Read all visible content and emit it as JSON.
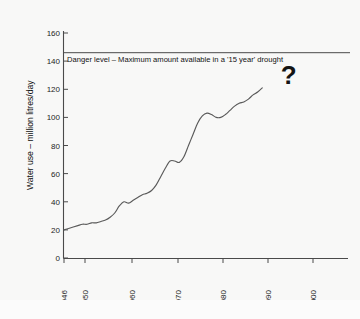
{
  "figure": {
    "background_color": "#f8f8f7",
    "line_color": "#5a5a5a",
    "axis_color": "#4a4a4a",
    "text_color": "#111111"
  },
  "caption": {
    "text": ""
  },
  "annotations": {
    "danger_label": "Danger level – Maximum amount available in a '15 year' drought",
    "question_mark": "?"
  },
  "chart_data": {
    "type": "line",
    "title": "",
    "subtitle": "",
    "xlabel": "",
    "ylabel": "Water use – million litres/day",
    "xlim": [
      1945,
      2004
    ],
    "ylim": [
      0,
      160
    ],
    "grid": false,
    "legend": "none",
    "xticks": [
      1946,
      1950,
      1960,
      1970,
      1980,
      1990,
      2000
    ],
    "xticklabels": [
      "1946",
      "1950",
      "1960",
      "1970",
      "1980",
      "1990",
      "2000"
    ],
    "yticks": [
      0,
      20,
      40,
      60,
      80,
      100,
      120,
      140,
      160
    ],
    "yticklabels": [
      "0",
      "20",
      "40",
      "60",
      "80",
      "100",
      "120",
      "140",
      "160"
    ],
    "annotations": [
      {
        "name": "danger-level-line",
        "type": "hline",
        "value": 146,
        "label": "Danger level – Maximum amount available in a '15 year' drought",
        "x_start": 1945,
        "x_end": 2003
      },
      {
        "name": "future-uncertainty-marker",
        "type": "text",
        "text": "?",
        "x": 1993,
        "y": 124
      }
    ],
    "series": [
      {
        "name": "Water use",
        "x": [
          1946,
          1947,
          1948,
          1949,
          1950,
          1951,
          1952,
          1953,
          1954,
          1955,
          1956,
          1957,
          1958,
          1959,
          1960,
          1961,
          1962,
          1963,
          1964,
          1965,
          1966,
          1967,
          1968,
          1969,
          1970,
          1971,
          1972,
          1973,
          1974,
          1975,
          1976,
          1977,
          1978,
          1979,
          1980,
          1981,
          1982,
          1983,
          1984,
          1985,
          1986,
          1987,
          1988,
          1989
        ],
        "values": [
          20,
          21,
          22,
          23,
          24,
          24,
          25,
          25,
          26,
          27,
          29,
          32,
          37,
          40,
          39,
          41,
          43,
          45,
          46,
          48,
          52,
          58,
          64,
          69,
          69,
          68,
          72,
          80,
          88,
          96,
          101,
          103,
          102,
          100,
          100,
          102,
          105,
          108,
          110,
          111,
          113,
          116,
          118,
          121
        ]
      }
    ]
  }
}
